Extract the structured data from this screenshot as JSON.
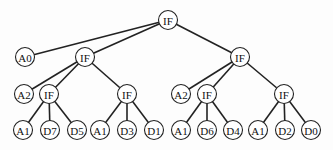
{
  "diagram": {
    "type": "tree",
    "title": "",
    "node_radius": 9.5,
    "nodes": [
      {
        "id": "n0",
        "label": "IF",
        "x": 168,
        "y": 20
      },
      {
        "id": "n1",
        "label": "A0",
        "x": 25,
        "y": 57
      },
      {
        "id": "n2",
        "label": "IF",
        "x": 85,
        "y": 57
      },
      {
        "id": "n3",
        "label": "IF",
        "x": 240,
        "y": 57
      },
      {
        "id": "n4",
        "label": "A2",
        "x": 24,
        "y": 94
      },
      {
        "id": "n5",
        "label": "IF",
        "x": 49,
        "y": 94
      },
      {
        "id": "n6",
        "label": "IF",
        "x": 127,
        "y": 94
      },
      {
        "id": "n7",
        "label": "A2",
        "x": 181,
        "y": 94
      },
      {
        "id": "n8",
        "label": "IF",
        "x": 207,
        "y": 94
      },
      {
        "id": "n9",
        "label": "IF",
        "x": 284,
        "y": 94
      },
      {
        "id": "n10",
        "label": "A1",
        "x": 23,
        "y": 130
      },
      {
        "id": "n11",
        "label": "D7",
        "x": 50,
        "y": 130
      },
      {
        "id": "n12",
        "label": "D5",
        "x": 77,
        "y": 130
      },
      {
        "id": "n13",
        "label": "A1",
        "x": 100,
        "y": 130
      },
      {
        "id": "n14",
        "label": "D3",
        "x": 127,
        "y": 130
      },
      {
        "id": "n15",
        "label": "D1",
        "x": 154,
        "y": 130
      },
      {
        "id": "n16",
        "label": "A1",
        "x": 181,
        "y": 130
      },
      {
        "id": "n17",
        "label": "D6",
        "x": 207,
        "y": 130
      },
      {
        "id": "n18",
        "label": "D4",
        "x": 233,
        "y": 130
      },
      {
        "id": "n19",
        "label": "A1",
        "x": 258,
        "y": 130
      },
      {
        "id": "n20",
        "label": "D2",
        "x": 285,
        "y": 130
      },
      {
        "id": "n21",
        "label": "D0",
        "x": 311,
        "y": 130
      }
    ],
    "edges": [
      [
        "n0",
        "n1"
      ],
      [
        "n0",
        "n2"
      ],
      [
        "n0",
        "n3"
      ],
      [
        "n2",
        "n4"
      ],
      [
        "n2",
        "n5"
      ],
      [
        "n2",
        "n6"
      ],
      [
        "n3",
        "n7"
      ],
      [
        "n3",
        "n8"
      ],
      [
        "n3",
        "n9"
      ],
      [
        "n5",
        "n10"
      ],
      [
        "n5",
        "n11"
      ],
      [
        "n5",
        "n12"
      ],
      [
        "n6",
        "n13"
      ],
      [
        "n6",
        "n14"
      ],
      [
        "n6",
        "n15"
      ],
      [
        "n8",
        "n16"
      ],
      [
        "n8",
        "n17"
      ],
      [
        "n8",
        "n18"
      ],
      [
        "n9",
        "n19"
      ],
      [
        "n9",
        "n20"
      ],
      [
        "n9",
        "n21"
      ]
    ]
  }
}
